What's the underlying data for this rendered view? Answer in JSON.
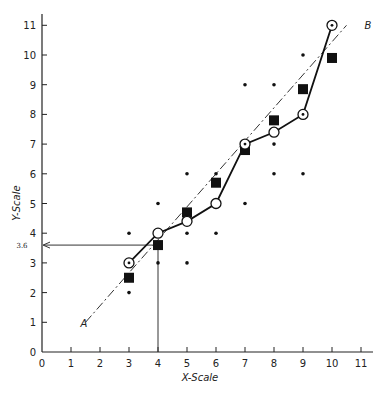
{
  "chart_data": {
    "type": "scatter",
    "title": "",
    "xlabel": "X-Scale",
    "ylabel": "Y-Scale",
    "xlim": [
      0,
      11
    ],
    "ylim": [
      0,
      11
    ],
    "x_ticks": [
      0,
      1,
      2,
      3,
      4,
      5,
      6,
      7,
      8,
      9,
      10,
      11
    ],
    "y_ticks": [
      0,
      1,
      2,
      3,
      4,
      5,
      6,
      7,
      8,
      9,
      10,
      11
    ],
    "grid": false,
    "annotations": [
      {
        "type": "arrow-guide",
        "label": "3.6",
        "from": [
          4,
          0
        ],
        "via": [
          4,
          3.6
        ],
        "to": [
          0,
          3.6
        ]
      },
      {
        "type": "line-label",
        "text": "A",
        "at": [
          1.5,
          1
        ]
      },
      {
        "type": "line-label",
        "text": "B",
        "at": [
          10.5,
          11
        ]
      }
    ],
    "series": [
      {
        "name": "Observed points",
        "marker": "dot",
        "points": [
          [
            3,
            2
          ],
          [
            3,
            4
          ],
          [
            4,
            3
          ],
          [
            4,
            5
          ],
          [
            5,
            3
          ],
          [
            5,
            4
          ],
          [
            5,
            6
          ],
          [
            6,
            4
          ],
          [
            6,
            6
          ],
          [
            7,
            5
          ],
          [
            7,
            9
          ],
          [
            8,
            6
          ],
          [
            8,
            7
          ],
          [
            8,
            9
          ],
          [
            9,
            6
          ],
          [
            9,
            10
          ]
        ]
      },
      {
        "name": "Column means",
        "marker": "open-circle",
        "connected": true,
        "points": [
          [
            3,
            3
          ],
          [
            4,
            4
          ],
          [
            5,
            4.4
          ],
          [
            6,
            5
          ],
          [
            7,
            7
          ],
          [
            8,
            7.4
          ],
          [
            9,
            8
          ],
          [
            10,
            11
          ]
        ],
        "dotted_center": [
          true,
          false,
          false,
          false,
          true,
          false,
          true,
          true
        ]
      },
      {
        "name": "Regression line estimates",
        "marker": "filled-square",
        "points": [
          [
            3,
            2.5
          ],
          [
            4,
            3.6
          ],
          [
            5,
            4.7
          ],
          [
            6,
            5.7
          ],
          [
            7,
            6.8
          ],
          [
            8,
            7.8
          ],
          [
            9,
            8.85
          ],
          [
            10,
            9.9
          ]
        ]
      },
      {
        "name": "Regression line A-B",
        "style": "dash-dot",
        "points": [
          [
            1.5,
            1
          ],
          [
            10.5,
            11
          ]
        ]
      }
    ]
  },
  "labels": {
    "x_axis_title": "X-Scale",
    "y_axis_title": "Y-Scale",
    "guide_value": "3.6",
    "line_start": "A",
    "line_end": "B"
  }
}
